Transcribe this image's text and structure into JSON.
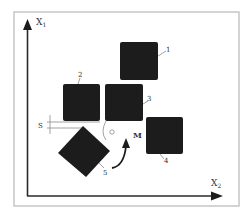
{
  "diagram": {
    "axes": {
      "y_label": "X",
      "y_sub": "1",
      "x_label": "X",
      "x_sub": "2"
    },
    "squares": [
      {
        "id": "1",
        "label": "1"
      },
      {
        "id": "2",
        "label": "2"
      },
      {
        "id": "3",
        "label": "3"
      },
      {
        "id": "4",
        "label": "4"
      }
    ],
    "diamond": {
      "id": "5",
      "label": "5"
    },
    "dimension_label": "S",
    "moment_label": "M",
    "colors": {
      "block": "#1c1c1c",
      "frame": "#b8b8b8",
      "axis": "#2a2a2a",
      "line": "#8a8a8a"
    }
  }
}
